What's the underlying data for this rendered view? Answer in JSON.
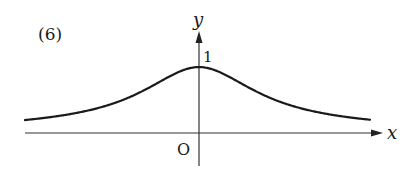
{
  "problem_label": "(6)",
  "chart_data": {
    "type": "line",
    "title": "",
    "xlabel": "x",
    "ylabel": "y",
    "origin_label": "O",
    "y_tick_labels": [
      "1"
    ],
    "function_shape": "bell curve, max 1 at x=0, symmetric, asymptotic to y=0 (approx. y = 1/(1+x^2))",
    "series": [
      {
        "name": "curve",
        "x": [
          -2.5,
          -2.0,
          -1.5,
          -1.0,
          -0.5,
          0,
          0.5,
          1.0,
          1.5,
          2.0,
          2.5
        ],
        "values": [
          0.14,
          0.2,
          0.31,
          0.5,
          0.8,
          1.0,
          0.8,
          0.5,
          0.31,
          0.2,
          0.14
        ]
      }
    ],
    "grid": false,
    "legend": "none",
    "colors": {
      "line": "#1a1a1a",
      "axes": "#333333"
    }
  }
}
